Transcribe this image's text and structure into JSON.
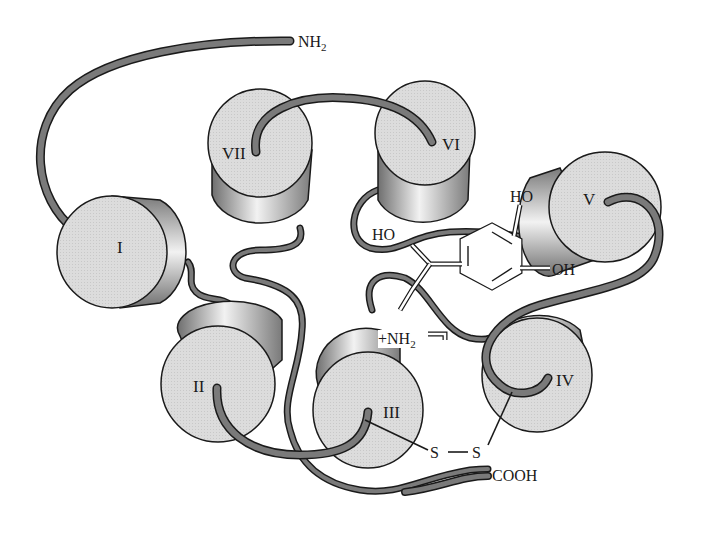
{
  "diagram": {
    "title": "",
    "type": "seven-transmembrane receptor with bound ligand (top view)",
    "termini": {
      "n_terminus": "NH",
      "n_terminus_sub": "2",
      "c_terminus": "COOH"
    },
    "helices": [
      {
        "id": "I",
        "label": "I"
      },
      {
        "id": "II",
        "label": "II"
      },
      {
        "id": "III",
        "label": "III"
      },
      {
        "id": "IV",
        "label": "IV"
      },
      {
        "id": "V",
        "label": "V"
      },
      {
        "id": "VI",
        "label": "VI"
      },
      {
        "id": "VII",
        "label": "VII"
      }
    ],
    "ligand": {
      "hydroxyl_top": "HO",
      "hydroxyl_side": "HO",
      "hydroxyl_ring": "OH",
      "amine_prefix": "+NH",
      "amine_sub": "2"
    },
    "disulfide": {
      "s1": "S",
      "bond": "—",
      "s2": "S"
    },
    "colors": {
      "helix_face": "#d9d9d9",
      "helix_side_dark": "#8a8a8a",
      "loop": "#6e6e6e",
      "outline": "#1a1a1a"
    }
  }
}
